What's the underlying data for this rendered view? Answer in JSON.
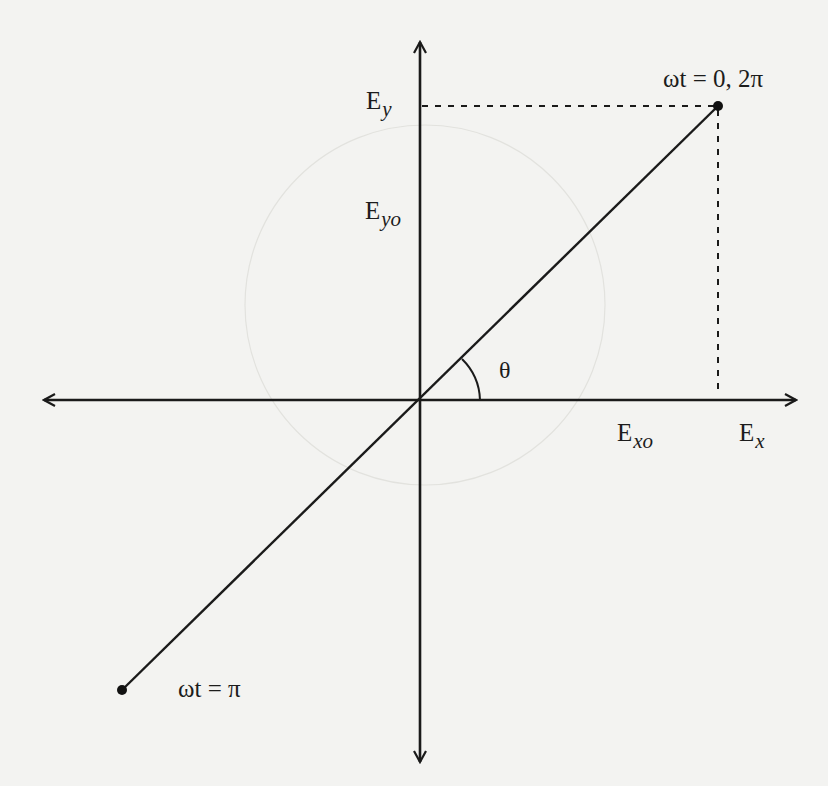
{
  "diagram": {
    "axes": {
      "x_label": {
        "main": "E",
        "sub": "x"
      },
      "y_label": {
        "main": "E",
        "sub": "y"
      }
    },
    "amplitude_labels": {
      "x_amplitude": {
        "main": "E",
        "sub": "xo"
      },
      "y_amplitude": {
        "main": "E",
        "sub": "yo"
      }
    },
    "angle_label": "θ",
    "points": [
      {
        "id": "start",
        "label": "ωt = 0, 2π"
      },
      {
        "id": "half",
        "label": "ωt = π"
      }
    ]
  },
  "colors": {
    "background": "#f3f3f1",
    "ink": "#1a1a1a"
  }
}
